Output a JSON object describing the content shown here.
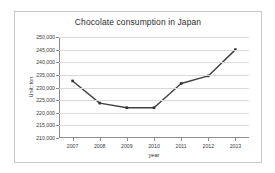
{
  "chart_data": {
    "type": "line",
    "title": "Chocolate consumption in Japan",
    "xlabel": "year",
    "ylabel": "Unit: ton",
    "categories": [
      "2007",
      "2008",
      "2009",
      "2010",
      "2011",
      "2012",
      "2013"
    ],
    "values": [
      232600,
      223800,
      222000,
      222000,
      231600,
      234600,
      245000
    ],
    "series": [
      {
        "name": "Chocolate consumption",
        "values": [
          232600,
          223800,
          222000,
          222000,
          231600,
          234600,
          245000
        ]
      }
    ],
    "ylim": [
      210000,
      250000
    ],
    "yticks": [
      210000,
      215000,
      220000,
      225000,
      230000,
      235000,
      240000,
      245000,
      250000
    ],
    "ytick_labels": [
      "210,000",
      "215,000",
      "220,000",
      "225,000",
      "230,000",
      "235,000",
      "240,000",
      "245,000",
      "250,000"
    ],
    "grid": true,
    "legend": "none",
    "line_color": "#404040",
    "marker_color": "#333333",
    "grid_color": "#d9d9d9",
    "axis_color": "#8c8c8c",
    "plot_background": "#ffffff"
  }
}
